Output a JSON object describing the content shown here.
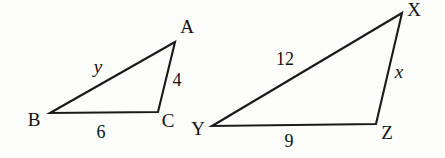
{
  "figure": {
    "type": "similar-triangles-diagram",
    "background_color": "#fdfdfc",
    "stroke_color": "#1a1a1a",
    "width": 445,
    "height": 158
  },
  "triangle_left": {
    "name": "triangle-abc",
    "vertices": [
      {
        "id": "A",
        "label": "A",
        "x": 175,
        "y": 42,
        "label_x": 187,
        "label_y": 26
      },
      {
        "id": "B",
        "label": "B",
        "x": 50,
        "y": 113,
        "label_x": 34,
        "label_y": 119
      },
      {
        "id": "C",
        "label": "C",
        "x": 158,
        "y": 112,
        "label_x": 168,
        "label_y": 120
      }
    ],
    "sides": [
      {
        "id": "AB",
        "label": "y",
        "italic": true,
        "label_x": 98,
        "label_y": 66
      },
      {
        "id": "AC",
        "label": "4",
        "italic": false,
        "label_x": 177,
        "label_y": 80
      },
      {
        "id": "BC",
        "label": "6",
        "italic": false,
        "label_x": 101,
        "label_y": 132
      }
    ],
    "path": "M 175 42 L 50 113 L 158 112 L 175 42 Z"
  },
  "triangle_xyz": {
    "name": "triangle-xyz",
    "vertices": [
      {
        "id": "X",
        "label": "X",
        "x": 402,
        "y": 13,
        "label_x": 414,
        "label_y": 9
      },
      {
        "id": "Y",
        "label": "Y",
        "x": 212,
        "y": 126,
        "label_x": 198,
        "label_y": 128
      },
      {
        "id": "Z",
        "label": "Z",
        "x": 376,
        "y": 124,
        "label_x": 387,
        "label_y": 132
      }
    ],
    "sides": [
      {
        "id": "XY",
        "label": "12",
        "italic": false,
        "label_x": 285,
        "label_y": 59
      },
      {
        "id": "XZ",
        "label": "x",
        "italic": true,
        "label_x": 399,
        "label_y": 71
      },
      {
        "id": "YZ",
        "label": "9",
        "italic": false,
        "label_x": 289,
        "label_y": 141
      }
    ],
    "path": "M 402 13 L 212 126 L 376 124 L 402 13 Z"
  }
}
